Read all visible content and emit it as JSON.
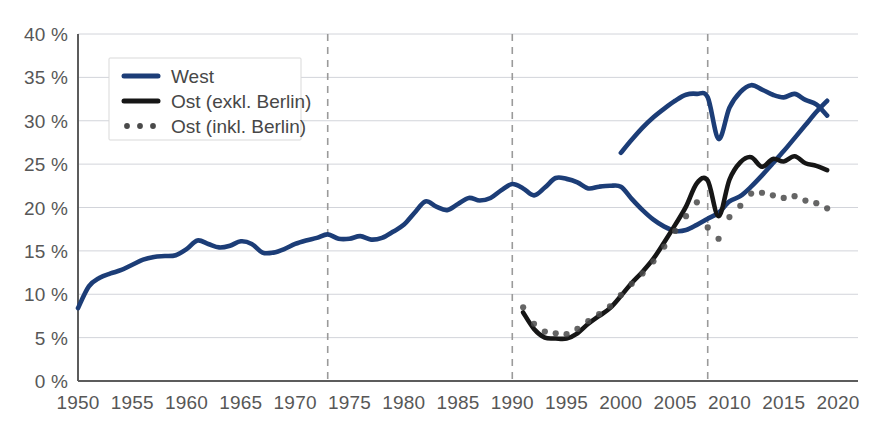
{
  "chart_data": {
    "type": "line",
    "title": "",
    "subtitle": "",
    "xlabel": "",
    "ylabel": "",
    "xlim": [
      1950,
      2020
    ],
    "ylim": [
      0,
      40
    ],
    "grid": true,
    "legend_position": "top-left",
    "y_tick_labels": [
      "40 %",
      "35 %",
      "30 %",
      "25 %",
      "20 %",
      "15 %",
      "10 %",
      "5 %",
      "0 %"
    ],
    "y_ticks": [
      40,
      35,
      30,
      25,
      20,
      15,
      10,
      5,
      0
    ],
    "x_tick_labels": [
      "1950",
      "1955",
      "1960",
      "1965",
      "1970",
      "1975",
      "1980",
      "1985",
      "1990",
      "1995",
      "2000",
      "2005",
      "2010",
      "2015",
      "2020"
    ],
    "x_ticks": [
      1950,
      1955,
      1960,
      1965,
      1970,
      1975,
      1980,
      1985,
      1990,
      1995,
      2000,
      2005,
      2010,
      2015,
      2020
    ],
    "annotations": [
      {
        "name": "event-line-1973",
        "x": 1973,
        "style": "dashed-vertical"
      },
      {
        "name": "event-line-1990",
        "x": 1990,
        "style": "dashed-vertical"
      },
      {
        "name": "event-line-2008",
        "x": 2008,
        "style": "dashed-vertical"
      }
    ],
    "colors": {
      "west": "#1c3d77",
      "ost_exkl": "#161616",
      "ost_inkl": "#4a4a4a",
      "grid": "#d2d4da",
      "axis": "#5c5c5c",
      "event": "#9a9a9a",
      "text": "#575757",
      "background": "#ffffff"
    },
    "series": [
      {
        "name": "West",
        "key": "west",
        "style": "solid",
        "color": "#1c3d77",
        "x": [
          1950,
          1951,
          1952,
          1953,
          1954,
          1955,
          1956,
          1957,
          1958,
          1959,
          1960,
          1961,
          1962,
          1963,
          1964,
          1965,
          1966,
          1967,
          1968,
          1969,
          1970,
          1971,
          1972,
          1973,
          1974,
          1975,
          1976,
          1977,
          1978,
          1979,
          1980,
          1981,
          1982,
          1983,
          1984,
          1985,
          1986,
          1987,
          1988,
          1989,
          1990,
          1991,
          1992,
          1993,
          1994,
          1995,
          1996,
          1997,
          1998,
          1999,
          2000,
          2001,
          2002,
          2003,
          2004,
          2005,
          2006,
          2007,
          2008,
          2009,
          2010,
          2011,
          2012,
          2013,
          2014,
          2015,
          2016,
          2017,
          2018,
          2019
        ],
        "values": [
          8.4,
          10.9,
          11.9,
          12.4,
          12.8,
          13.4,
          14.0,
          14.3,
          14.4,
          14.5,
          15.2,
          16.2,
          15.8,
          15.4,
          15.6,
          16.1,
          15.8,
          14.8,
          14.8,
          15.2,
          15.8,
          16.2,
          16.5,
          16.9,
          16.4,
          16.4,
          16.7,
          16.3,
          16.5,
          17.2,
          18.0,
          19.4,
          20.7,
          20.1,
          19.7,
          20.4,
          21.1,
          20.8,
          21.1,
          22.0,
          22.7,
          22.2,
          21.4,
          22.3,
          23.4,
          23.3,
          22.9,
          22.2,
          22.4,
          22.5,
          22.4,
          21.0,
          19.7,
          18.6,
          17.8,
          17.3,
          17.4,
          18.0,
          18.7,
          19.4,
          20.7,
          21.3,
          22.4,
          23.7,
          25.1,
          26.5,
          28.0,
          29.5,
          31.0,
          32.3
        ]
      },
      {
        "name": "West (continued)",
        "key": "west_tail",
        "style": "solid",
        "color": "#1c3d77",
        "x": [
          2000,
          2001,
          2002,
          2003,
          2004,
          2005,
          2006,
          2007,
          2008,
          2009,
          2010,
          2011,
          2012,
          2013,
          2014,
          2015,
          2016,
          2017,
          2018,
          2019
        ],
        "values": [
          26.3,
          27.8,
          29.2,
          30.4,
          31.4,
          32.3,
          33.0,
          33.1,
          32.7,
          27.9,
          31.5,
          33.3,
          34.1,
          33.6,
          33.0,
          32.7,
          33.1,
          32.4,
          31.9,
          30.6
        ]
      },
      {
        "name": "Ost (exkl. Berlin)",
        "key": "ost_exkl",
        "style": "solid",
        "color": "#161616",
        "x": [
          1991,
          1992,
          1993,
          1994,
          1995,
          1996,
          1997,
          1998,
          1999,
          2000,
          2001,
          2002,
          2003,
          2004,
          2005,
          2006,
          2007,
          2008,
          2009,
          2010,
          2011,
          2012,
          2013,
          2014,
          2015,
          2016,
          2017,
          2018,
          2019
        ],
        "values": [
          7.9,
          6.0,
          5.0,
          4.9,
          4.9,
          5.5,
          6.6,
          7.5,
          8.4,
          9.8,
          11.3,
          12.6,
          14.1,
          16.0,
          18.0,
          20.1,
          22.8,
          23.1,
          19.0,
          23.2,
          25.2,
          25.8,
          24.7,
          25.6,
          25.3,
          25.9,
          25.1,
          24.8,
          24.3
        ]
      },
      {
        "name": "Ost (inkl. Berlin)",
        "key": "ost_inkl",
        "style": "dotted",
        "color": "#4a4a4a",
        "x": [
          1991,
          1992,
          1993,
          1994,
          1995,
          1996,
          1997,
          1998,
          1999,
          2000,
          2001,
          2002,
          2003,
          2004,
          2005,
          2006,
          2007,
          2008,
          2009,
          2010,
          2011,
          2012,
          2013,
          2014,
          2015,
          2016,
          2017,
          2018,
          2019
        ],
        "values": [
          8.5,
          6.6,
          5.7,
          5.5,
          5.4,
          6.0,
          6.9,
          7.7,
          8.6,
          9.9,
          11.2,
          12.4,
          13.8,
          15.5,
          17.3,
          19.0,
          20.6,
          17.7,
          16.4,
          18.9,
          20.2,
          21.6,
          21.7,
          21.4,
          21.1,
          21.3,
          20.8,
          20.5,
          19.9
        ]
      }
    ],
    "legend": [
      {
        "label": "West",
        "marker": "solid-line",
        "color": "#1c3d77"
      },
      {
        "label": "Ost (exkl. Berlin)",
        "marker": "solid-line",
        "color": "#161616"
      },
      {
        "label": "Ost (inkl. Berlin)",
        "marker": "dotted-line",
        "color": "#4a4a4a"
      }
    ]
  }
}
